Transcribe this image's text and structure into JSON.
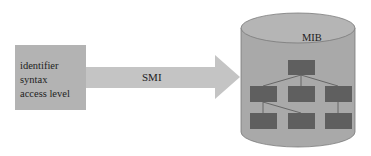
{
  "diagram": {
    "source_box": {
      "lines": [
        "identifier",
        "syntax",
        "access level"
      ]
    },
    "arrow": {
      "label": "SMI"
    },
    "database": {
      "label": "MIB",
      "tree": {
        "levels": [
          1,
          3,
          3
        ],
        "node_color": "#5f5f5f"
      }
    },
    "colors": {
      "box_fill": "#b3b3b3",
      "arrow_fill": "#c4c4c4",
      "cylinder_fill": "#a8a8a8",
      "cylinder_top": "#b4b4b4",
      "node_fill": "#5f5f5f",
      "edge_color": "#555555"
    }
  }
}
